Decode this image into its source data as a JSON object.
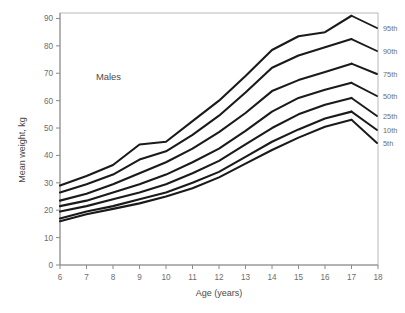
{
  "chart_data": {
    "type": "line",
    "title": "",
    "annotation": "Males",
    "xlabel": "Age (years)",
    "ylabel": "Mean weight, kg",
    "xlim": [
      6,
      18
    ],
    "ylim": [
      0,
      92
    ],
    "xticks": [
      6,
      7,
      8,
      9,
      10,
      11,
      12,
      13,
      14,
      15,
      16,
      17,
      18
    ],
    "yticks": [
      0,
      10,
      20,
      30,
      40,
      50,
      60,
      70,
      80,
      90
    ],
    "grid": false,
    "legend_position": "right-inline-labels",
    "x": [
      6,
      7,
      8,
      9,
      10,
      11,
      12,
      13,
      14,
      15,
      16,
      17
    ],
    "series": [
      {
        "name": "95th",
        "label": "95th",
        "values": [
          29.0,
          32.5,
          36.5,
          44.0,
          45.0,
          52.5,
          60.0,
          69.0,
          78.5,
          83.5,
          85.0,
          91.0
        ]
      },
      {
        "name": "90th",
        "label": "90th",
        "values": [
          26.5,
          29.5,
          33.0,
          38.5,
          41.5,
          47.5,
          54.5,
          63.0,
          72.0,
          76.5,
          79.5,
          82.5
        ]
      },
      {
        "name": "75th",
        "label": "75th",
        "values": [
          23.5,
          26.0,
          29.5,
          33.5,
          37.5,
          42.5,
          48.5,
          55.5,
          63.5,
          67.5,
          70.5,
          73.5
        ]
      },
      {
        "name": "50th",
        "label": "50th",
        "values": [
          21.5,
          23.5,
          26.5,
          29.5,
          33.0,
          37.5,
          42.5,
          49.0,
          56.0,
          61.0,
          64.0,
          66.5
        ]
      },
      {
        "name": "25th",
        "label": "25th",
        "values": [
          19.5,
          21.5,
          24.0,
          26.5,
          29.5,
          33.5,
          38.0,
          44.0,
          50.0,
          55.0,
          58.5,
          61.0
        ]
      },
      {
        "name": "10th",
        "label": "10th",
        "values": [
          17.0,
          19.5,
          21.5,
          24.0,
          26.5,
          30.0,
          34.0,
          39.5,
          45.0,
          49.5,
          53.5,
          56.0
        ]
      },
      {
        "name": "5th",
        "label": "5th",
        "values": [
          16.0,
          18.5,
          20.5,
          22.5,
          25.0,
          28.0,
          32.0,
          37.0,
          42.0,
          46.5,
          50.5,
          53.0
        ]
      }
    ]
  },
  "axes": {
    "y_title": "Mean weight, kg",
    "x_title": "Age (years)",
    "y_tick_labels": [
      "0",
      "10",
      "20",
      "30",
      "40",
      "50",
      "60",
      "70",
      "80",
      "90"
    ],
    "x_tick_labels": [
      "6",
      "7",
      "8",
      "9",
      "10",
      "11",
      "12",
      "13",
      "14",
      "15",
      "16",
      "17",
      "18"
    ]
  },
  "annotations": {
    "group": "Males"
  },
  "colors": {
    "curve": "#1a1a1a",
    "axis": "#8a8a8a",
    "tick_text": "#6d6d6d",
    "axis_title": "#4a4a4a",
    "background": "#ffffff"
  }
}
